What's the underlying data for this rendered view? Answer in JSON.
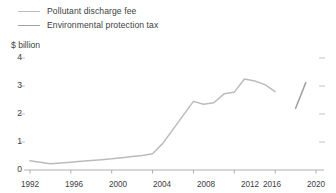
{
  "legend": {
    "position": "top-left",
    "items": [
      {
        "label": "Pollutant discharge fee",
        "color": "#b9bcbe",
        "key": "discharge"
      },
      {
        "label": "Environmental protection tax",
        "color": "#9da2a6",
        "key": "tax"
      }
    ]
  },
  "axis": {
    "unit_label": "$ billion",
    "y_ticks": [
      "0",
      "1",
      "2",
      "3",
      "4"
    ],
    "x_ticks": [
      "1992",
      "1996",
      "2000",
      "2004",
      "2008",
      "2012",
      "2016",
      "2020"
    ]
  },
  "chart_data": {
    "type": "line",
    "title": "",
    "subtitle": "",
    "xlabel": "",
    "ylabel": "$ billion",
    "ylim": [
      0,
      4
    ],
    "xlim": [
      1992,
      2020
    ],
    "grid": false,
    "legend_position": "top-left",
    "x_tick_values": [
      1992,
      1996,
      2000,
      2004,
      2008,
      2012,
      2016,
      2020
    ],
    "y_tick_values": [
      0,
      1,
      2,
      3,
      4
    ],
    "annotations": [],
    "series": [
      {
        "name": "Pollutant discharge fee",
        "color": "#b9bcbe",
        "x": [
          1992,
          1993,
          1994,
          1995,
          1996,
          1997,
          1998,
          1999,
          2000,
          2001,
          2002,
          2003,
          2004,
          2005,
          2006,
          2007,
          2008,
          2009,
          2010,
          2011,
          2012,
          2013,
          2014,
          2015,
          2016
        ],
        "values": [
          0.33,
          0.28,
          0.22,
          0.25,
          0.28,
          0.31,
          0.34,
          0.37,
          0.4,
          0.44,
          0.48,
          0.52,
          0.58,
          0.95,
          1.45,
          1.95,
          2.45,
          2.35,
          2.4,
          2.72,
          2.78,
          3.25,
          3.18,
          3.05,
          2.8
        ]
      },
      {
        "name": "Environmental protection tax",
        "color": "#9da2a6",
        "x": [
          2018,
          2019
        ],
        "values": [
          2.2,
          3.12
        ]
      }
    ]
  }
}
